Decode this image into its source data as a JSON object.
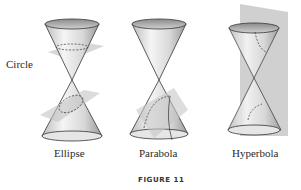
{
  "figure": {
    "caption": "FIGURE 11",
    "panels": [
      {
        "id": "ellipse",
        "label": "Ellipse",
        "sub_label": "Circle"
      },
      {
        "id": "parabola",
        "label": "Parabola"
      },
      {
        "id": "hyperbola",
        "label": "Hyperbola"
      }
    ]
  },
  "colors": {
    "cone_light": "#f4f4f4",
    "cone_dark": "#9a9a9a",
    "plane": "#c8c8c8",
    "outline": "#333333"
  }
}
